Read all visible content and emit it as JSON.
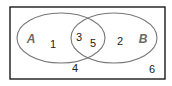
{
  "diagram": {
    "type": "venn",
    "universe": {
      "x": 10,
      "y": 7,
      "width": 155,
      "height": 72,
      "stroke": "#1a1a1a"
    },
    "sets": [
      {
        "name": "A",
        "cx": 61,
        "cy": 38,
        "rx": 44,
        "ry": 25,
        "label_x": 31,
        "label_y": 43,
        "stroke": "#777777"
      },
      {
        "name": "B",
        "cx": 114,
        "cy": 38,
        "rx": 43,
        "ry": 25,
        "label_x": 143,
        "label_y": 43,
        "stroke": "#777777"
      }
    ],
    "elements": [
      {
        "value": "1",
        "region": "A only",
        "x": 53,
        "y": 48
      },
      {
        "value": "3",
        "region": "A and B",
        "x": 79,
        "y": 41
      },
      {
        "value": "5",
        "region": "A and B",
        "x": 93,
        "y": 47
      },
      {
        "value": "2",
        "region": "B only",
        "x": 120,
        "y": 45
      },
      {
        "value": "4",
        "region": "neither",
        "x": 75,
        "y": 72
      },
      {
        "value": "6",
        "region": "neither",
        "x": 152,
        "y": 73
      }
    ]
  }
}
